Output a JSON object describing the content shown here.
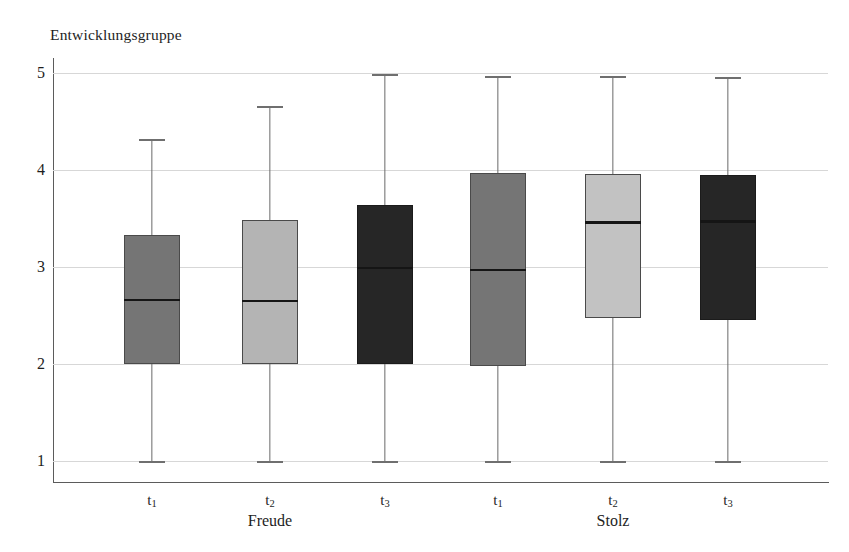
{
  "chart_data": {
    "type": "box",
    "title": "Entwicklungsgruppe",
    "xlabel": "",
    "ylabel": "Entwicklungsgruppe",
    "ylim": [
      1,
      5
    ],
    "yticks": [
      1,
      2,
      3,
      4,
      5
    ],
    "ytick_labels": [
      "1",
      "2",
      "3",
      "4",
      "5"
    ],
    "grid": true,
    "legend": "none",
    "groups": [
      {
        "name": "Freude",
        "categories": [
          "t1",
          "t2",
          "t3"
        ]
      },
      {
        "name": "Stolz",
        "categories": [
          "t1",
          "t2",
          "t3"
        ]
      }
    ],
    "categories": [
      "t1",
      "t2",
      "t3",
      "t1",
      "t2",
      "t3"
    ],
    "boxes": [
      {
        "group": "Freude",
        "category": "t1",
        "label": "t",
        "sub": "1",
        "whisker_low": 1.0,
        "q1": 2.0,
        "median": 2.66,
        "q3": 3.33,
        "whisker_high": 4.32,
        "fill": "#757575"
      },
      {
        "group": "Freude",
        "category": "t2",
        "label": "t",
        "sub": "2",
        "whisker_low": 1.0,
        "q1": 2.0,
        "median": 2.65,
        "q3": 3.48,
        "whisker_high": 4.66,
        "fill": "#b4b4b4"
      },
      {
        "group": "Freude",
        "category": "t3",
        "label": "t",
        "sub": "3",
        "whisker_low": 1.0,
        "q1": 2.0,
        "median": 2.99,
        "q3": 3.64,
        "whisker_high": 4.99,
        "fill": "#262626"
      },
      {
        "group": "Stolz",
        "category": "t1",
        "label": "t",
        "sub": "1",
        "whisker_low": 1.0,
        "q1": 1.98,
        "median": 2.97,
        "q3": 3.97,
        "whisker_high": 4.97,
        "fill": "#757575"
      },
      {
        "group": "Stolz",
        "category": "t2",
        "label": "t",
        "sub": "2",
        "whisker_low": 1.0,
        "q1": 2.47,
        "median": 3.46,
        "q3": 3.96,
        "whisker_high": 4.97,
        "fill": "#c2c2c2"
      },
      {
        "group": "Stolz",
        "category": "t3",
        "label": "t",
        "sub": "3",
        "whisker_low": 1.0,
        "q1": 2.45,
        "median": 3.47,
        "q3": 3.95,
        "whisker_high": 4.96,
        "fill": "#262626"
      }
    ],
    "colors": {
      "fill_medium_gray": "#757575",
      "fill_light_gray": "#b8b8b8",
      "fill_dark": "#262626",
      "gridline": "#d7d7d7",
      "axis": "#5b5b5b",
      "median": "#151515",
      "text": "#1e1e1e",
      "background": "#ffffff"
    }
  }
}
